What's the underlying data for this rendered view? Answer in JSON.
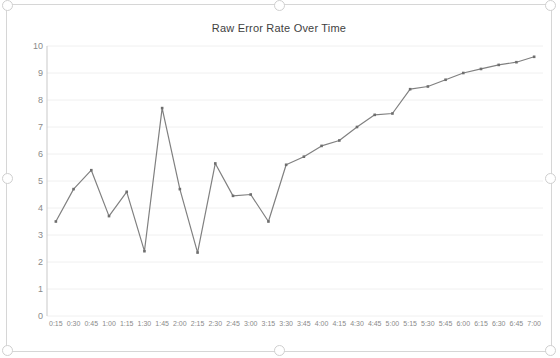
{
  "chart_data": {
    "type": "line",
    "title": "Raw Error Rate Over Time",
    "xlabel": "",
    "ylabel": "",
    "ylim": [
      0,
      10
    ],
    "ytick_step": 1,
    "yticks": [
      "0",
      "1",
      "2",
      "3",
      "4",
      "5",
      "6",
      "7",
      "8",
      "9",
      "10"
    ],
    "grid": true,
    "legend": "none",
    "line_color": "#808080",
    "marker": "square",
    "marker_color": "#6e6e6e",
    "categories": [
      "0:15",
      "0:30",
      "0:45",
      "1:00",
      "1:15",
      "1:30",
      "1:45",
      "2:00",
      "2:15",
      "2:30",
      "2:45",
      "3:00",
      "3:15",
      "3:30",
      "3:45",
      "4:00",
      "4:15",
      "4:30",
      "4:45",
      "5:00",
      "5:15",
      "5:30",
      "5:45",
      "6:00",
      "6:15",
      "6:30",
      "6:45",
      "7:00"
    ],
    "values": [
      3.5,
      4.7,
      5.4,
      3.7,
      4.6,
      2.4,
      7.7,
      4.7,
      2.35,
      5.65,
      4.45,
      4.5,
      3.5,
      5.6,
      5.9,
      6.3,
      6.5,
      7.0,
      7.45,
      7.5,
      8.4,
      8.5,
      8.75,
      9.0,
      9.15,
      9.3,
      9.4,
      9.6
    ],
    "series_name": "Raw Error Rate"
  },
  "frame": {
    "handles": [
      "handle-top-left",
      "handle-top-center",
      "handle-top-right",
      "handle-middle-left",
      "handle-middle-right",
      "handle-bottom-left",
      "handle-bottom-center",
      "handle-bottom-right"
    ]
  }
}
